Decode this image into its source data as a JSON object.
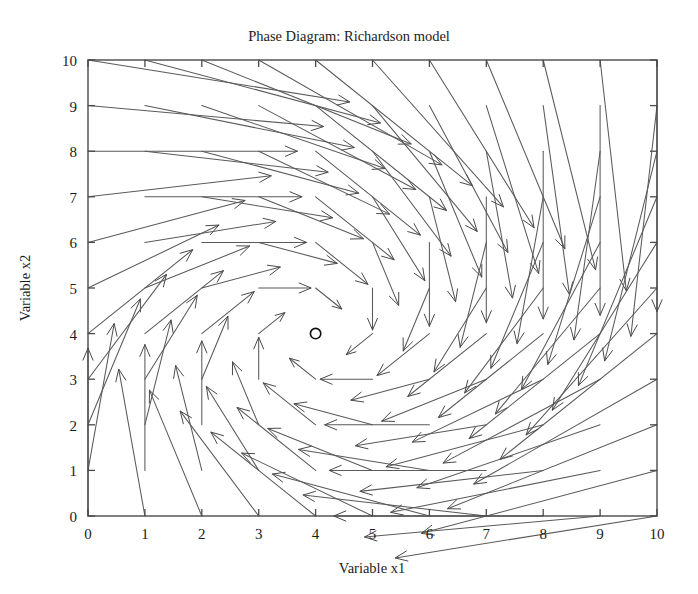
{
  "chart_data": {
    "type": "scatter",
    "subtype": "vector-field-quiver",
    "title": "Phase Diagram: Richardson model",
    "xlabel": "Variable x1",
    "ylabel": "Variable x2",
    "xlim": [
      0,
      10
    ],
    "ylim": [
      0,
      10
    ],
    "xticks": [
      0,
      1,
      2,
      3,
      4,
      5,
      6,
      7,
      8,
      9,
      10
    ],
    "yticks": [
      0,
      1,
      2,
      3,
      4,
      5,
      6,
      7,
      8,
      9,
      10
    ],
    "xtick_labels": [
      "0",
      "1",
      "2",
      "3",
      "4",
      "5",
      "6",
      "7",
      "8",
      "9",
      "10"
    ],
    "ytick_labels": [
      "0",
      "1",
      "2",
      "3",
      "4",
      "5",
      "6",
      "7",
      "8",
      "9",
      "10"
    ],
    "grid": false,
    "legend": null,
    "grid_step": 1,
    "equilibrium_point": {
      "x": 4,
      "y": 4,
      "marker": "circle",
      "label": ""
    },
    "vector_model": {
      "description": "Richardson arms race model linearized about equilibrium (4,4)",
      "dx1dt": "(x2 - 4) - (x1 - 4)",
      "dx2dt": "-(x1 - 4) - (x2 - 4)",
      "arrow_scale": 0.46
    },
    "sample_vectors": [
      {
        "x": 0,
        "y": 10,
        "u": 6,
        "v": -6
      },
      {
        "x": 2,
        "y": 10,
        "u": 4,
        "v": -4
      },
      {
        "x": 4,
        "y": 10,
        "u": 2,
        "v": -2
      },
      {
        "x": 5,
        "y": 10,
        "u": 1,
        "v": -1
      },
      {
        "x": 6,
        "y": 10,
        "u": 0,
        "v": -2
      },
      {
        "x": 8,
        "y": 10,
        "u": -2,
        "v": -4
      },
      {
        "x": 10,
        "y": 10,
        "u": -4,
        "v": -6
      },
      {
        "x": 0,
        "y": 6,
        "u": 2,
        "v": -2
      },
      {
        "x": 10,
        "y": 6,
        "u": -8,
        "v": -2
      },
      {
        "x": 0,
        "y": 4,
        "u": 4,
        "v": 0
      },
      {
        "x": 10,
        "y": 4,
        "u": -6,
        "v": 0
      },
      {
        "x": 0,
        "y": 0,
        "u": 0,
        "v": 4
      },
      {
        "x": 4,
        "y": 0,
        "u": -4,
        "v": 0
      },
      {
        "x": 10,
        "y": 0,
        "u": -10,
        "v": 6
      },
      {
        "x": 0,
        "y": 2,
        "u": -2,
        "v": 2
      },
      {
        "x": 2,
        "y": 0,
        "u": -2,
        "v": 2
      }
    ]
  },
  "title": "Phase Diagram: Richardson model",
  "axes": {
    "x": {
      "label": "Variable x1"
    },
    "y": {
      "label": "Variable x2"
    }
  }
}
